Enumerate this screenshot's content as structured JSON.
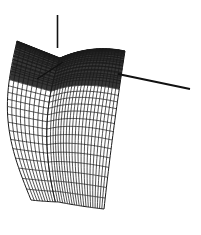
{
  "figure": {
    "title": "",
    "background_color": "#ffffff",
    "line_color": "#1a1a1a",
    "width_px": 201,
    "height_px": 235,
    "caption": ""
  },
  "chart_data": {
    "type": "line",
    "title": "",
    "subtitle": "",
    "xlabel": "",
    "ylabel": "",
    "zlabel": "",
    "render_style": "wireframe-mesh",
    "grid": true,
    "legend": "none",
    "projection": "perspective-3d",
    "axes": [
      {
        "name": "vertical-axis",
        "x1": 57.5,
        "y1": 15,
        "x2": 57.5,
        "y2": 48,
        "stroke_width": 1.6,
        "tick_labels": [],
        "label": ""
      },
      {
        "name": "right-axis",
        "x1": 118,
        "y1": 74,
        "x2": 190,
        "y2": 89,
        "stroke_width": 2.0,
        "tick_labels": [],
        "label": ""
      },
      {
        "name": "lower-left-axis",
        "x1": 63,
        "y1": 62,
        "x2": 37,
        "y2": 79,
        "stroke_width": 1.4,
        "tick_labels": [],
        "label": ""
      }
    ],
    "surface": {
      "name": "twisted-ruled-surface",
      "u_divisions": 30,
      "v_divisions": 26,
      "shading": "dense-at-top",
      "top_left_tip": [
        17,
        41
      ],
      "top_right_corner": [
        125,
        51
      ],
      "ridge_point": [
        60,
        58
      ],
      "bottom_left_corner": [
        31,
        196
      ],
      "bottom_right_corner": [
        104,
        209
      ],
      "right_edge_top": [
        122,
        88
      ],
      "left_edge_top": [
        58,
        75
      ]
    },
    "series": [
      {
        "name": "u-gridlines",
        "count": 30,
        "orientation": "generatrix",
        "values": []
      },
      {
        "name": "v-gridlines",
        "count": 26,
        "orientation": "directrix",
        "values": []
      }
    ],
    "x": [],
    "values": [],
    "categories": [],
    "annotations": []
  }
}
